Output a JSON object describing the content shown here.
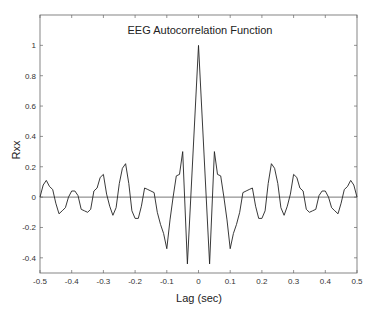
{
  "chart_data": {
    "type": "line",
    "title": "EEG Autocorrelation Function",
    "xlabel": "Lag (sec)",
    "ylabel": "Rxx",
    "xlim": [
      -0.5,
      0.5
    ],
    "ylim": [
      -0.5,
      1.2
    ],
    "grid": false,
    "legend": null,
    "xticks": [
      -0.5,
      -0.4,
      -0.3,
      -0.2,
      -0.1,
      0,
      0.1,
      0.2,
      0.3,
      0.4,
      0.5
    ],
    "xtick_labels": [
      "-0.5",
      "-0.4",
      "-0.3",
      "-0.2",
      "-0.1",
      "0",
      "0.1",
      "0.2",
      "0.3",
      "0.4",
      "0.5"
    ],
    "yticks": [
      -0.4,
      -0.2,
      0,
      0.2,
      0.4,
      0.6,
      0.8,
      1
    ],
    "ytick_labels": [
      "-0.4",
      "-0.2",
      "0",
      "0.2",
      "0.4",
      "0.6",
      "0.8",
      "1"
    ],
    "reference_line": {
      "y": 0
    },
    "series": [
      {
        "name": "Rxx",
        "color": "#222222",
        "x": [
          -0.5,
          -0.49,
          -0.48,
          -0.47,
          -0.46,
          -0.45,
          -0.44,
          -0.43,
          -0.42,
          -0.41,
          -0.4,
          -0.39,
          -0.38,
          -0.37,
          -0.36,
          -0.35,
          -0.34,
          -0.33,
          -0.32,
          -0.31,
          -0.3,
          -0.29,
          -0.28,
          -0.27,
          -0.26,
          -0.25,
          -0.24,
          -0.23,
          -0.22,
          -0.21,
          -0.2,
          -0.19,
          -0.18,
          -0.17,
          -0.16,
          -0.15,
          -0.14,
          -0.13,
          -0.12,
          -0.11,
          -0.1,
          -0.09,
          -0.08,
          -0.07,
          -0.06,
          -0.05,
          -0.035,
          0,
          0.035,
          0.05,
          0.06,
          0.07,
          0.08,
          0.09,
          0.1,
          0.11,
          0.12,
          0.13,
          0.14,
          0.15,
          0.16,
          0.17,
          0.18,
          0.19,
          0.2,
          0.21,
          0.22,
          0.23,
          0.24,
          0.25,
          0.26,
          0.27,
          0.28,
          0.29,
          0.3,
          0.31,
          0.32,
          0.33,
          0.34,
          0.35,
          0.36,
          0.37,
          0.38,
          0.39,
          0.4,
          0.41,
          0.42,
          0.43,
          0.44,
          0.45,
          0.46,
          0.47,
          0.48,
          0.49,
          0.5
        ],
        "values": [
          0.0,
          0.08,
          0.11,
          0.07,
          0.05,
          -0.04,
          -0.11,
          -0.09,
          -0.07,
          0.0,
          0.04,
          0.04,
          0.01,
          -0.08,
          -0.09,
          -0.1,
          -0.08,
          0.04,
          0.06,
          0.13,
          0.15,
          0.02,
          -0.06,
          -0.12,
          -0.07,
          0.09,
          0.19,
          0.22,
          0.09,
          -0.09,
          -0.14,
          -0.14,
          -0.06,
          0.06,
          0.05,
          0.04,
          0.03,
          -0.1,
          -0.18,
          -0.24,
          -0.34,
          -0.15,
          0.0,
          0.14,
          0.15,
          0.3,
          -0.44,
          1.0,
          -0.44,
          0.3,
          0.15,
          0.14,
          0.0,
          -0.15,
          -0.34,
          -0.24,
          -0.18,
          -0.1,
          0.03,
          0.04,
          0.05,
          0.06,
          -0.06,
          -0.14,
          -0.14,
          -0.09,
          0.09,
          0.22,
          0.19,
          0.09,
          -0.07,
          -0.12,
          -0.06,
          0.02,
          0.15,
          0.13,
          0.06,
          0.04,
          -0.08,
          -0.1,
          -0.09,
          -0.08,
          0.01,
          0.04,
          0.04,
          0.0,
          -0.07,
          -0.09,
          -0.11,
          -0.04,
          0.05,
          0.07,
          0.11,
          0.08,
          0.0
        ]
      }
    ]
  }
}
